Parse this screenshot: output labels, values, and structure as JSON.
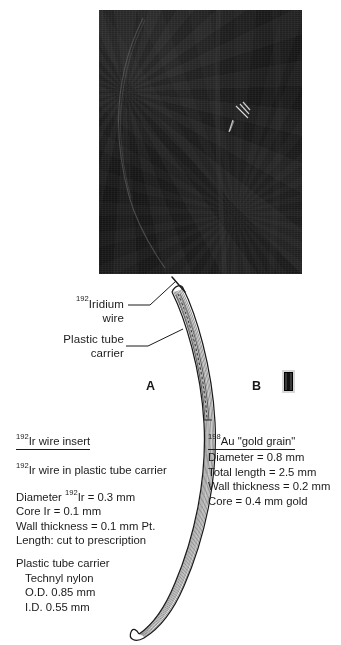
{
  "figure": {
    "panels": [
      {
        "letter": "A",
        "name": "panel-a-iridium-wire"
      },
      {
        "letter": "B",
        "name": "panel-b-gold-grain"
      }
    ]
  },
  "radiograph": {
    "alt": "radiograph-photograph",
    "background_color": "#161616",
    "features": [
      "faint-curved-catheter-arc",
      "bright-gold-grain-streaks"
    ]
  },
  "callouts": {
    "iridium_wire": {
      "superscript": "192",
      "line1": "Iridium",
      "line2": "wire"
    },
    "plastic_tube_carrier": {
      "line1": "Plastic tube",
      "line2": "carrier"
    }
  },
  "ir_block": {
    "heading_sup": "192",
    "heading_text": "Ir wire insert",
    "subtitle_sup": "192",
    "subtitle_text": "Ir wire in plastic tube carrier",
    "spec_diameter_pre": "Diameter ",
    "spec_diameter_sup": "192",
    "spec_diameter_post": "Ir = 0.3 mm",
    "spec_core": "Core Ir = 0.1 mm",
    "spec_wall": "Wall thickness = 0.1 mm Pt.",
    "spec_length": "Length: cut to prescription",
    "carrier_title": "Plastic tube carrier",
    "carrier_material": "Technyl nylon",
    "carrier_od": "O.D. 0.85 mm",
    "carrier_id": "I.D. 0.55 mm"
  },
  "au_block": {
    "heading_sup": "198",
    "heading_text": "Au \"gold grain\"",
    "spec_diameter": "Diameter = 0.8 mm",
    "spec_total_length": "Total length = 2.5 mm",
    "spec_wall": "Wall thickness = 0.2 mm",
    "spec_core": "Core = 0.4 mm gold"
  },
  "colors": {
    "ink": "#1b1b1b",
    "page": "#ffffff",
    "film": "#161616",
    "grain_shell": "#d7d7d7",
    "grain_core": "#111111"
  }
}
